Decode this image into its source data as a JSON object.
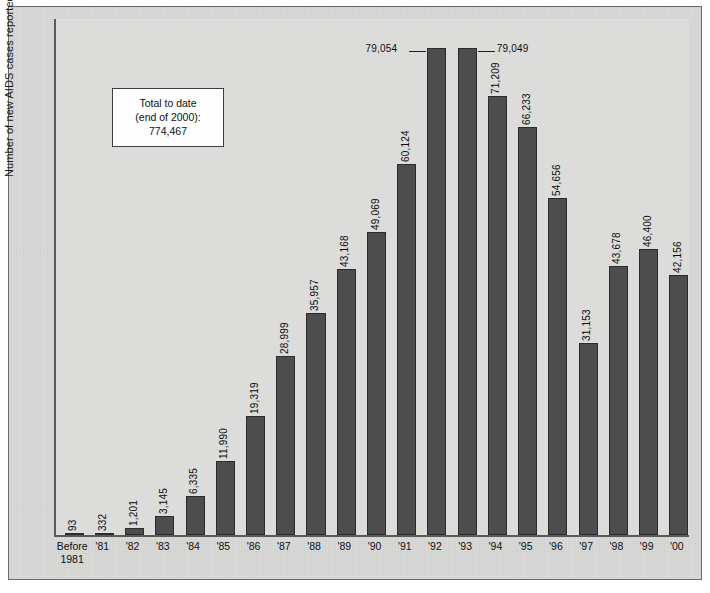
{
  "chart": {
    "ylabel": "Number of new AIDS cases reported",
    "annotation": {
      "line1": "Total to date",
      "line2": "(end of 2000):",
      "line3": "774,467"
    }
  },
  "chart_data": {
    "type": "bar",
    "title": "",
    "xlabel": "",
    "ylabel": "Number of new AIDS cases reported",
    "ylim": [
      0,
      84000
    ],
    "grid": false,
    "legend": "none",
    "bar_color": "#4d4d4d",
    "plot_background": "#dcdcda",
    "figure_background": "#d6d6d4",
    "annotation_text": "Total to date (end of 2000): 774,467",
    "total_to_date": "774,467",
    "categories": [
      "Before 1981",
      "'81",
      "'82",
      "'83",
      "'84",
      "'85",
      "'86",
      "'87",
      "'88",
      "'89",
      "'90",
      "'91",
      "'92",
      "'93",
      "'94",
      "'95",
      "'96",
      "'97",
      "'98",
      "'99",
      "'00"
    ],
    "category_labels": [
      {
        "line1": "Before",
        "line2": "1981"
      },
      {
        "line1": "'81",
        "line2": ""
      },
      {
        "line1": "'82",
        "line2": ""
      },
      {
        "line1": "'83",
        "line2": ""
      },
      {
        "line1": "'84",
        "line2": ""
      },
      {
        "line1": "'85",
        "line2": ""
      },
      {
        "line1": "'86",
        "line2": ""
      },
      {
        "line1": "'87",
        "line2": ""
      },
      {
        "line1": "'88",
        "line2": ""
      },
      {
        "line1": "'89",
        "line2": ""
      },
      {
        "line1": "'90",
        "line2": ""
      },
      {
        "line1": "'91",
        "line2": ""
      },
      {
        "line1": "'92",
        "line2": ""
      },
      {
        "line1": "'93",
        "line2": ""
      },
      {
        "line1": "'94",
        "line2": ""
      },
      {
        "line1": "'95",
        "line2": ""
      },
      {
        "line1": "'96",
        "line2": ""
      },
      {
        "line1": "'97",
        "line2": ""
      },
      {
        "line1": "'98",
        "line2": ""
      },
      {
        "line1": "'99",
        "line2": ""
      },
      {
        "line1": "'00",
        "line2": ""
      }
    ],
    "values": [
      93,
      332,
      1201,
      3145,
      6335,
      11990,
      19319,
      28999,
      35957,
      43168,
      49069,
      60124,
      79054,
      79049,
      71209,
      66233,
      54656,
      31153,
      43678,
      46400,
      42156
    ],
    "value_labels": [
      "93",
      "332",
      "1,201",
      "3,145",
      "6,335",
      "11,990",
      "19,319",
      "28,999",
      "35,957",
      "43,168",
      "49,069",
      "60,124",
      "79,054",
      "79,049",
      "71,209",
      "66,233",
      "54,656",
      "31,153",
      "43,678",
      "46,400",
      "42,156"
    ],
    "label_orientation": [
      "vertical",
      "vertical",
      "vertical",
      "vertical",
      "vertical",
      "vertical",
      "vertical",
      "vertical",
      "vertical",
      "vertical",
      "vertical",
      "vertical",
      "horizontal-left",
      "horizontal-right",
      "vertical",
      "vertical",
      "vertical",
      "vertical",
      "vertical",
      "vertical",
      "vertical"
    ]
  }
}
